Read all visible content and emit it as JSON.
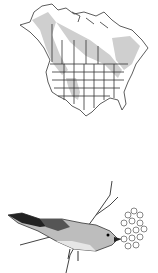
{
  "figure": {
    "map": {
      "kind": "range-map",
      "region": "North America",
      "range_shade_color": "#c8c8c8",
      "border_color": "#333333"
    },
    "illustration": {
      "kind": "bird-on-branch",
      "subject": "bird",
      "details": "bird perched on branch with berry cluster"
    }
  }
}
